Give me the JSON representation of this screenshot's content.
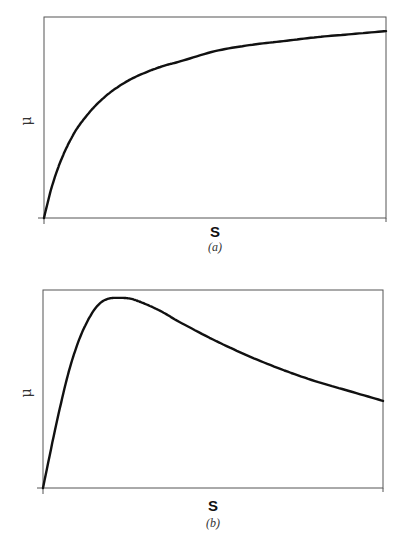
{
  "chart_data": [
    {
      "type": "line",
      "panel": "a",
      "caption": "(a)",
      "title": "",
      "xlabel": "S",
      "ylabel": "μ",
      "grid": false,
      "legend": null,
      "model": "Monod-type saturating curve (rises steeply then levels off)",
      "x_normalized": [
        0,
        0.02,
        0.04,
        0.06,
        0.08,
        0.1,
        0.13,
        0.16,
        0.2,
        0.25,
        0.3,
        0.35,
        0.4,
        0.5,
        0.6,
        0.7,
        0.8,
        0.9,
        1.0
      ],
      "y_normalized": [
        0,
        0.138,
        0.244,
        0.328,
        0.397,
        0.454,
        0.52,
        0.575,
        0.633,
        0.687,
        0.726,
        0.757,
        0.78,
        0.83,
        0.86,
        0.88,
        0.9,
        0.915,
        0.93
      ],
      "xlim": [
        0,
        1
      ],
      "ylim": [
        0,
        1
      ]
    },
    {
      "type": "line",
      "panel": "b",
      "caption": "(b)",
      "title": "",
      "xlabel": "S",
      "ylabel": "μ",
      "grid": false,
      "legend": null,
      "model": "Substrate-inhibition (Haldane-type) curve: rises to a maximum then declines",
      "x_normalized": [
        0,
        0.035,
        0.07,
        0.1,
        0.13,
        0.16,
        0.19,
        0.226,
        0.26,
        0.3,
        0.35,
        0.4,
        0.5,
        0.6,
        0.7,
        0.8,
        0.9,
        1.0
      ],
      "y_normalized": [
        0,
        0.29,
        0.55,
        0.72,
        0.84,
        0.92,
        0.955,
        0.96,
        0.955,
        0.93,
        0.89,
        0.84,
        0.75,
        0.67,
        0.6,
        0.54,
        0.49,
        0.44
      ],
      "xlim": [
        0,
        1
      ],
      "ylim": [
        0,
        1
      ]
    }
  ],
  "panels": {
    "a": {
      "xlabel": "S",
      "ylabel": "μ",
      "caption": "(a)"
    },
    "b": {
      "xlabel": "S",
      "ylabel": "μ",
      "caption": "(b)"
    }
  },
  "colors": {
    "curve": "#111111",
    "frame": "#555555"
  }
}
